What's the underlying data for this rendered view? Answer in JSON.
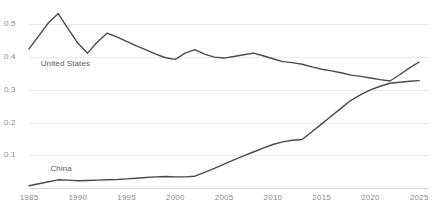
{
  "chart_data": {
    "type": "line",
    "title": "",
    "subtitle": "",
    "xlabel": "",
    "ylabel": "",
    "xlim": [
      1985,
      2026
    ],
    "ylim": [
      0,
      0.55
    ],
    "grid": true,
    "legend_position": "inline-labels",
    "x_ticks": [
      "1985",
      "1990",
      "1995",
      "2000",
      "2005",
      "2010",
      "2015",
      "2020",
      "2025"
    ],
    "x_tick_values": [
      1985,
      1990,
      1995,
      2000,
      2005,
      2010,
      2015,
      2020,
      2025
    ],
    "y_ticks": [
      "0.1",
      "0.2",
      "0.3",
      "0.4",
      "0.5"
    ],
    "y_tick_values": [
      0.1,
      0.2,
      0.3,
      0.4,
      0.5
    ],
    "series": [
      {
        "name": "United States",
        "color": "#4a4a4a",
        "label_x": 1986.2,
        "label_y": 0.378,
        "x": [
          1985,
          1986,
          1987,
          1988,
          1989,
          1990,
          1991,
          1992,
          1993,
          1994,
          1995,
          1996,
          1997,
          1998,
          1999,
          2000,
          2001,
          2002,
          2003,
          2004,
          2005,
          2006,
          2007,
          2008,
          2009,
          2010,
          2011,
          2012,
          2013,
          2014,
          2015,
          2016,
          2017,
          2018,
          2019,
          2020,
          2021,
          2022,
          2023,
          2024,
          2025
        ],
        "y": [
          0.425,
          0.465,
          0.505,
          0.533,
          0.487,
          0.443,
          0.412,
          0.446,
          0.473,
          0.462,
          0.448,
          0.434,
          0.422,
          0.409,
          0.398,
          0.393,
          0.412,
          0.423,
          0.409,
          0.4,
          0.397,
          0.402,
          0.407,
          0.412,
          0.404,
          0.395,
          0.386,
          0.383,
          0.378,
          0.37,
          0.363,
          0.358,
          0.352,
          0.345,
          0.341,
          0.336,
          0.331,
          0.327,
          0.346,
          0.367,
          0.385
        ]
      },
      {
        "name": "China",
        "color": "#4a4a4a",
        "label_x": 1987.2,
        "label_y": 0.058,
        "x": [
          1985,
          1986,
          1987,
          1988,
          1989,
          1990,
          1991,
          1992,
          1993,
          1994,
          1995,
          1996,
          1997,
          1998,
          1999,
          2000,
          2001,
          2002,
          2003,
          2004,
          2005,
          2006,
          2007,
          2008,
          2009,
          2010,
          2011,
          2012,
          2013,
          2014,
          2015,
          2016,
          2017,
          2018,
          2019,
          2020,
          2021,
          2022,
          2023,
          2024,
          2025
        ],
        "y": [
          0.007,
          0.013,
          0.019,
          0.025,
          0.024,
          0.022,
          0.023,
          0.024,
          0.025,
          0.026,
          0.028,
          0.03,
          0.032,
          0.034,
          0.035,
          0.034,
          0.034,
          0.036,
          0.048,
          0.06,
          0.073,
          0.086,
          0.098,
          0.11,
          0.122,
          0.133,
          0.141,
          0.146,
          0.148,
          0.172,
          0.196,
          0.22,
          0.244,
          0.268,
          0.285,
          0.3,
          0.311,
          0.32,
          0.323,
          0.326,
          0.328
        ]
      }
    ]
  }
}
